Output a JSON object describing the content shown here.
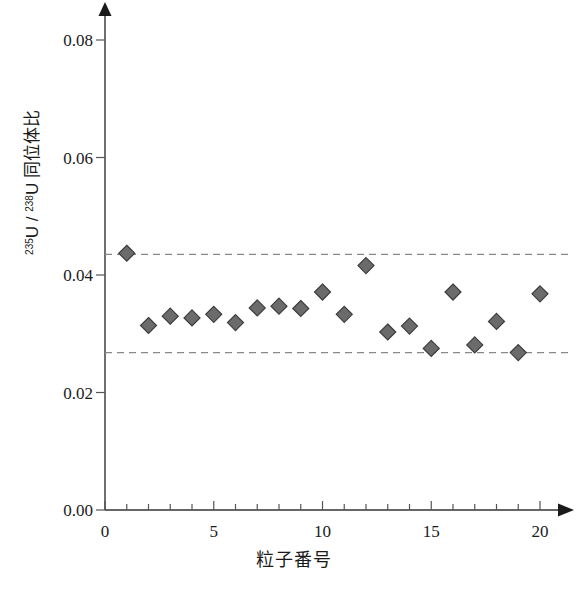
{
  "chart_data": {
    "type": "scatter",
    "title": "",
    "xlabel": "粒子番号",
    "ylabel": "235U / 238U 同位体比",
    "ylabel_parts": {
      "num_sup": "235",
      "num_base": "U",
      "slash": "/",
      "den_sup": "238",
      "den_base": "U",
      "suffix": "同位体比"
    },
    "x": [
      1,
      2,
      3,
      4,
      5,
      6,
      7,
      8,
      9,
      10,
      11,
      12,
      13,
      14,
      15,
      16,
      17,
      18,
      19,
      20
    ],
    "values": [
      0.0437,
      0.0314,
      0.033,
      0.0327,
      0.0333,
      0.0319,
      0.0344,
      0.0347,
      0.0343,
      0.0371,
      0.0333,
      0.0416,
      0.0303,
      0.0313,
      0.0275,
      0.0371,
      0.0281,
      0.0321,
      0.0268,
      0.0368
    ],
    "xlim": [
      0,
      21
    ],
    "ylim": [
      0.0,
      0.085
    ],
    "xticks": [
      0,
      5,
      10,
      15,
      20
    ],
    "xtick_labels": [
      "0",
      "5",
      "10",
      "15",
      "20"
    ],
    "xminor_step": 1,
    "yticks": [
      0.0,
      0.02,
      0.04,
      0.06,
      0.08
    ],
    "ytick_labels": [
      "0.00",
      "0.02",
      "0.04",
      "0.06",
      "0.08"
    ],
    "grid": false,
    "legend": "none",
    "marker": "diamond",
    "marker_color": "#6b6b6b",
    "marker_edge_color": "#3d3d3d",
    "reference_lines": [
      {
        "name": "upper-bound",
        "value": 0.0435,
        "style": "dashed",
        "color": "#888888"
      },
      {
        "name": "lower-bound",
        "value": 0.0268,
        "style": "dashed",
        "color": "#888888"
      }
    ],
    "axis_arrows": {
      "x": "right",
      "y": "up"
    }
  }
}
